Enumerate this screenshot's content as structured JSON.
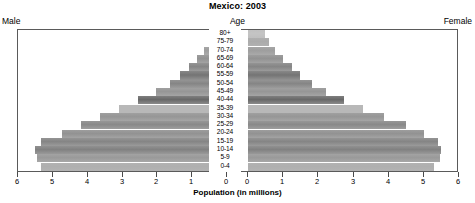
{
  "chart_data": {
    "type": "bar",
    "subtype": "population-pyramid",
    "title": "Mexico: 2003",
    "xlabel": "Population (in millions)",
    "ylabel": "Age",
    "grid": false,
    "legend": false,
    "left_label": "Male",
    "right_label": "Female",
    "center_header": "Age",
    "xlim": [
      0,
      6
    ],
    "xticks": [
      0,
      1,
      2,
      3,
      4,
      5,
      6
    ],
    "xtick_labels_left": [
      "6",
      "5",
      "4",
      "3",
      "2",
      "1",
      "0"
    ],
    "xtick_labels_right": [
      "0",
      "1",
      "2",
      "3",
      "4",
      "5",
      "6"
    ],
    "categories": [
      "80+",
      "75-79",
      "70-74",
      "65-69",
      "60-64",
      "55-59",
      "50-54",
      "45-49",
      "40-44",
      "35-39",
      "30-34",
      "25-29",
      "20-24",
      "15-19",
      "10-14",
      "5-9",
      "0-4"
    ],
    "series": [
      {
        "name": "Male",
        "side": "left",
        "values": [
          0.4,
          0.5,
          0.65,
          0.85,
          1.1,
          1.35,
          1.65,
          2.05,
          2.55,
          3.1,
          3.65,
          4.2,
          4.75,
          5.35,
          5.5,
          5.45,
          5.35
        ]
      },
      {
        "name": "Female",
        "side": "right",
        "values": [
          0.5,
          0.6,
          0.78,
          1.0,
          1.25,
          1.5,
          1.85,
          2.25,
          2.75,
          3.3,
          3.9,
          4.55,
          5.05,
          5.45,
          5.55,
          5.5,
          5.35
        ]
      }
    ]
  },
  "axis": {
    "xtitle": "Population (in millions)"
  }
}
